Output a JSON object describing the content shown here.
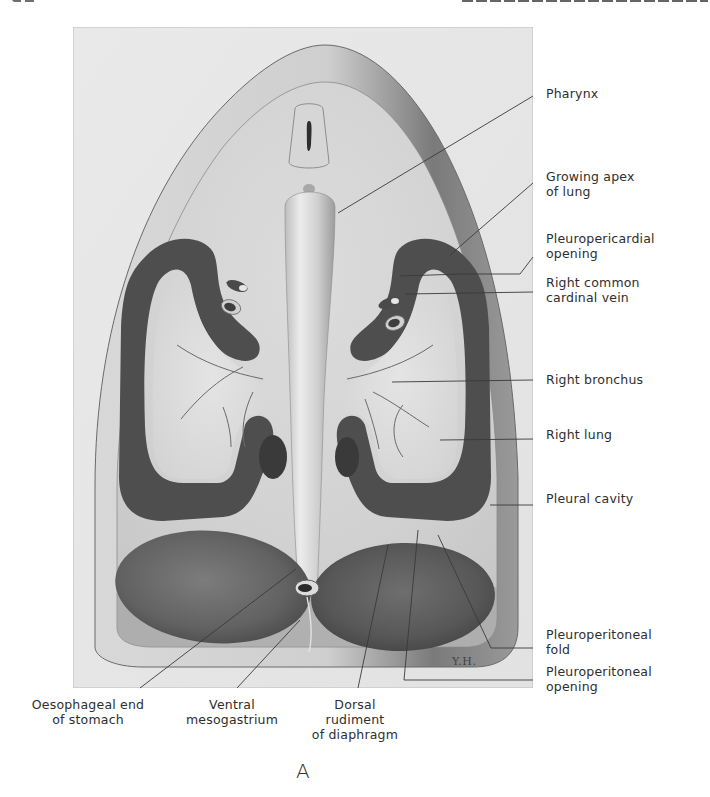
{
  "page": {
    "running_header": {
      "left_visible": "clipped page number (unreadable)",
      "right_visible": "clipped chapter heading (unreadable)"
    }
  },
  "figure": {
    "panel_letter": "A",
    "artist_initials": "Y.H.",
    "colors": {
      "frame_bg": "#e6e6e6",
      "tissue_light": "#dedede",
      "tissue_mid": "#b8b8b8",
      "cavity_dark": "#4e4e4e",
      "stomach": "#6a6a6a",
      "leader_line": "#3a3a3a",
      "label_text": "#2e2e2e"
    },
    "labels_right": [
      {
        "id": "pharynx",
        "lines": [
          "Pharynx"
        ]
      },
      {
        "id": "growing-apex-of-lung",
        "lines": [
          "Growing apex",
          "of lung"
        ]
      },
      {
        "id": "pleuropericardial-opening",
        "lines": [
          "Pleuropericardial",
          "opening"
        ]
      },
      {
        "id": "right-common-cardinal-vein",
        "lines": [
          "Right common",
          "cardinal vein"
        ]
      },
      {
        "id": "right-bronchus",
        "lines": [
          "Right bronchus"
        ]
      },
      {
        "id": "right-lung",
        "lines": [
          "Right lung"
        ]
      },
      {
        "id": "pleural-cavity",
        "lines": [
          "Pleural cavity"
        ]
      },
      {
        "id": "pleuroperitoneal-fold",
        "lines": [
          "Pleuroperitoneal",
          "fold"
        ]
      },
      {
        "id": "pleuroperitoneal-opening",
        "lines": [
          "Pleuroperitoneal",
          "opening"
        ]
      }
    ],
    "labels_bottom": [
      {
        "id": "oesophageal-end-of-stomach",
        "lines": [
          "Oesophageal end",
          "of stomach"
        ]
      },
      {
        "id": "ventral-mesogastrium",
        "lines": [
          "Ventral",
          "mesogastrium"
        ]
      },
      {
        "id": "dorsal-rudiment-of-diaphragm",
        "lines": [
          "Dorsal",
          "rudiment",
          "of diaphragm"
        ]
      }
    ]
  }
}
